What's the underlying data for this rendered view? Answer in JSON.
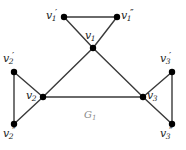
{
  "figure": {
    "caption": "G",
    "caption_sub": "1",
    "background": "#ffffff",
    "edge_color": "#3a3a3a",
    "node_color": "#000000",
    "label_color": "#1a1a1a",
    "caption_color": "#8a8a8a"
  },
  "nodes": [
    {
      "id": "v1p",
      "base": "v",
      "sub": "1",
      "prime": "′",
      "label": "v₁′",
      "x": 64,
      "y": 17,
      "label_x": 46,
      "label_y": 10
    },
    {
      "id": "v1pp",
      "base": "v",
      "sub": "1",
      "prime": "″",
      "label": "v₁″",
      "x": 117,
      "y": 17,
      "label_x": 121,
      "label_y": 10
    },
    {
      "id": "v1",
      "base": "v",
      "sub": "1",
      "prime": "",
      "label": "v₁",
      "x": 93,
      "y": 48,
      "label_x": 85,
      "label_y": 30
    },
    {
      "id": "v2p",
      "base": "v",
      "sub": "2",
      "prime": "′",
      "label": "v₂′",
      "x": 14,
      "y": 72,
      "label_x": 3,
      "label_y": 53
    },
    {
      "id": "v2",
      "base": "v",
      "sub": "2",
      "prime": "",
      "label": "v₂",
      "x": 43,
      "y": 97,
      "label_x": 26,
      "label_y": 90
    },
    {
      "id": "v2pp",
      "base": "v",
      "sub": "2",
      "prime": "″",
      "label": "v₂″",
      "x": 14,
      "y": 124,
      "label_x": 3,
      "label_y": 128
    },
    {
      "id": "v3p",
      "base": "v",
      "sub": "3",
      "prime": "′",
      "label": "v₃′",
      "x": 172,
      "y": 72,
      "label_x": 160,
      "label_y": 53
    },
    {
      "id": "v3",
      "base": "v",
      "sub": "3",
      "prime": "",
      "label": "v₃",
      "x": 143,
      "y": 97,
      "label_x": 147,
      "label_y": 90
    },
    {
      "id": "v3pp",
      "base": "v",
      "sub": "3",
      "prime": "″",
      "label": "v₃″",
      "x": 172,
      "y": 124,
      "label_x": 160,
      "label_y": 128
    }
  ],
  "edges": [
    {
      "from": "v1p",
      "to": "v1pp"
    },
    {
      "from": "v1p",
      "to": "v1"
    },
    {
      "from": "v1pp",
      "to": "v1"
    },
    {
      "from": "v2p",
      "to": "v2pp"
    },
    {
      "from": "v2p",
      "to": "v2"
    },
    {
      "from": "v2pp",
      "to": "v2"
    },
    {
      "from": "v3p",
      "to": "v3pp"
    },
    {
      "from": "v3p",
      "to": "v3"
    },
    {
      "from": "v3pp",
      "to": "v3"
    },
    {
      "from": "v1",
      "to": "v2"
    },
    {
      "from": "v1",
      "to": "v3"
    },
    {
      "from": "v2",
      "to": "v3"
    }
  ],
  "caption_pos": {
    "x": 84,
    "y": 110
  }
}
